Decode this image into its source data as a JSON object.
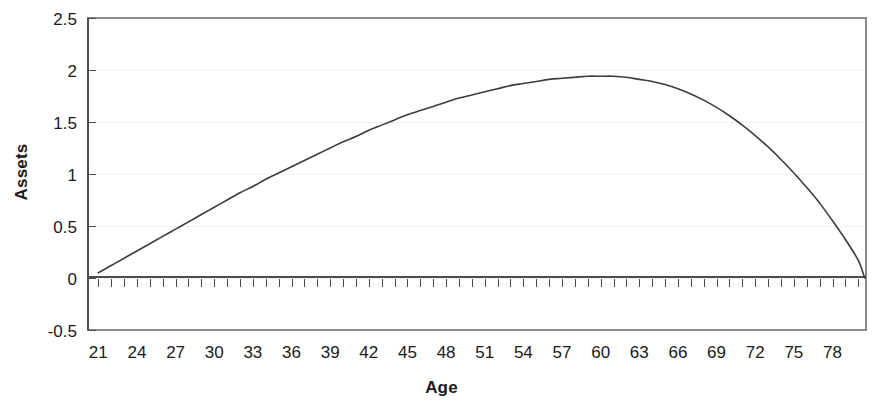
{
  "chart_data": {
    "type": "line",
    "title": "",
    "subtitle": "",
    "xlabel": "Age",
    "ylabel": "Assets",
    "xlim": [
      20.2,
      80.6
    ],
    "ylim": [
      -0.5,
      2.5
    ],
    "grid": "horizontal-faint",
    "legend": "none",
    "x_tick_labels": [
      "21",
      "24",
      "27",
      "30",
      "33",
      "36",
      "39",
      "42",
      "45",
      "48",
      "51",
      "54",
      "57",
      "60",
      "63",
      "66",
      "69",
      "72",
      "75",
      "78"
    ],
    "x_tick_values": [
      21,
      24,
      27,
      30,
      33,
      36,
      39,
      42,
      45,
      48,
      51,
      54,
      57,
      60,
      63,
      66,
      69,
      72,
      75,
      78
    ],
    "x_minor_tick_step": 1,
    "y_tick_labels": [
      "2.5",
      "2",
      "1.5",
      "1",
      "0.5",
      "0",
      "-0.5"
    ],
    "y_tick_values": [
      2.5,
      2,
      1.5,
      1,
      0.5,
      0,
      -0.5
    ],
    "series": [
      {
        "name": "Assets",
        "color": "#3c3c3c",
        "x": [
          21,
          22,
          23,
          24,
          25,
          26,
          27,
          28,
          29,
          30,
          31,
          32,
          33,
          34,
          35,
          36,
          37,
          38,
          39,
          40,
          41,
          42,
          43,
          44,
          45,
          46,
          47,
          48,
          49,
          50,
          51,
          52,
          53,
          54,
          55,
          56,
          57,
          58,
          59,
          60,
          61,
          62,
          63,
          64,
          65,
          66,
          67,
          68,
          69,
          70,
          71,
          72,
          73,
          74,
          75,
          76,
          77,
          78,
          79,
          80,
          80.5
        ],
        "values": [
          0.05,
          0.12,
          0.19,
          0.26,
          0.33,
          0.4,
          0.47,
          0.54,
          0.61,
          0.68,
          0.75,
          0.82,
          0.88,
          0.95,
          1.01,
          1.07,
          1.13,
          1.19,
          1.25,
          1.31,
          1.36,
          1.42,
          1.47,
          1.52,
          1.57,
          1.61,
          1.65,
          1.69,
          1.73,
          1.76,
          1.79,
          1.82,
          1.85,
          1.87,
          1.89,
          1.91,
          1.92,
          1.93,
          1.94,
          1.94,
          1.94,
          1.93,
          1.91,
          1.89,
          1.86,
          1.82,
          1.77,
          1.71,
          1.64,
          1.56,
          1.47,
          1.37,
          1.26,
          1.14,
          1.01,
          0.87,
          0.72,
          0.55,
          0.37,
          0.17,
          0.0
        ]
      }
    ],
    "peak": {
      "x": 60,
      "y": 1.94
    },
    "start": {
      "x": 21,
      "y": 0.05
    },
    "end": {
      "x": 80.5,
      "y": 0.0
    }
  },
  "colors": {
    "line": "#3c3c3c",
    "axis": "#595959",
    "grid": "#f2f2f2",
    "text": "#1a1a1a",
    "background": "#ffffff"
  }
}
